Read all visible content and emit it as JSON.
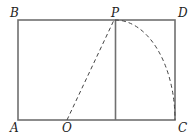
{
  "diagram": {
    "labels": {
      "A": "A",
      "B": "B",
      "C": "C",
      "D": "D",
      "O": "O",
      "P": "P"
    },
    "colors": {
      "stroke": "#6e6e6e",
      "dashed": "#444444",
      "label": "#222222"
    }
  }
}
